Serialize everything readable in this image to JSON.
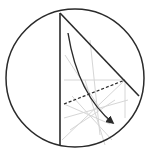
{
  "diagram": {
    "type": "origami-fold-diagram",
    "colors": {
      "outline": "#2a2a2a",
      "crease": "#d6d6d6",
      "background": "#ffffff"
    },
    "circle": {
      "cx": 75,
      "cy": 78,
      "r": 69
    },
    "paper_edges": [
      {
        "x1": 60,
        "y1": 13,
        "x2": 139,
        "y2": 96
      },
      {
        "x1": 60,
        "y1": 13,
        "x2": 60,
        "y2": 146
      }
    ],
    "fold_line": {
      "x1": 64,
      "y1": 104,
      "x2": 125,
      "y2": 80,
      "style": "dashed"
    },
    "arrow": {
      "from": [
        68,
        33
      ],
      "to": [
        113,
        123
      ],
      "control": [
        78,
        95
      ]
    },
    "crease_lines": [
      [
        64,
        80,
        125,
        80
      ],
      [
        125,
        80,
        125,
        118
      ],
      [
        64,
        104,
        110,
        124
      ],
      [
        62,
        140,
        125,
        80
      ],
      [
        65,
        55,
        110,
        124
      ],
      [
        90,
        40,
        100,
        135
      ],
      [
        64,
        118,
        128,
        100
      ],
      [
        70,
        130,
        115,
        100
      ],
      [
        72,
        96,
        112,
        140
      ],
      [
        85,
        80,
        105,
        145
      ]
    ]
  }
}
